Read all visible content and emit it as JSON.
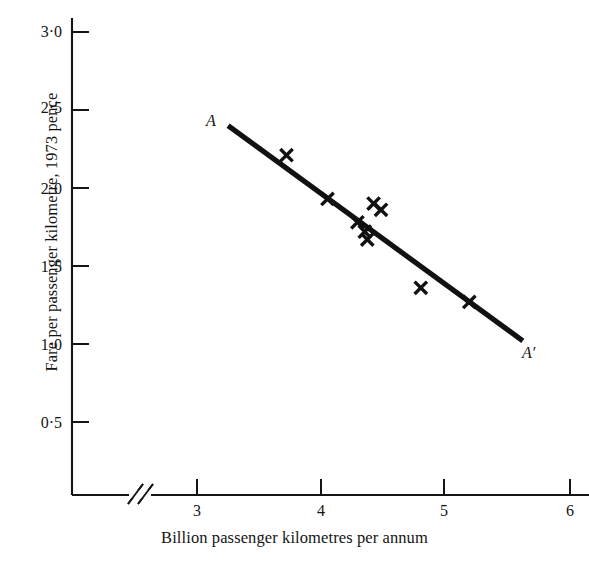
{
  "chart_data": {
    "type": "scatter",
    "title": "",
    "subtitle": "",
    "xlabel": "Billion passenger kilometres per annum",
    "ylabel": "Fare per passenger kilometre, 1973 pence",
    "xlim": [
      2.55,
      6.25
    ],
    "ylim": [
      0.18,
      3.12
    ],
    "x_ticks": [
      "3",
      "4",
      "5",
      "6"
    ],
    "x_tick_values": [
      3,
      4,
      5,
      6
    ],
    "y_ticks": [
      "0·5",
      "1·0",
      "1·5",
      "2·0",
      "2·5",
      "3·0"
    ],
    "y_tick_values": [
      0.5,
      1.0,
      1.5,
      2.0,
      2.5,
      3.0
    ],
    "grid": false,
    "legend": "none",
    "axis_break": "x-axis break between origin and first tick",
    "marker": "cross",
    "points": [
      {
        "x": 3.72,
        "y": 2.21
      },
      {
        "x": 4.05,
        "y": 1.93
      },
      {
        "x": 4.29,
        "y": 1.78
      },
      {
        "x": 4.35,
        "y": 1.72
      },
      {
        "x": 4.37,
        "y": 1.67
      },
      {
        "x": 4.42,
        "y": 1.9
      },
      {
        "x": 4.48,
        "y": 1.86
      },
      {
        "x": 4.8,
        "y": 1.36
      },
      {
        "x": 5.19,
        "y": 1.27
      }
    ],
    "series": [
      {
        "name": "Fitted line A-A'",
        "type": "line",
        "start": {
          "x": 3.25,
          "y": 2.4,
          "label": "A"
        },
        "end": {
          "x": 5.62,
          "y": 1.02,
          "label": "A′"
        }
      }
    ],
    "annotations": [
      {
        "name": "line-start-label",
        "text": "A"
      },
      {
        "name": "line-end-label",
        "text": "A′"
      }
    ],
    "colors": {
      "ink": "#141414",
      "background": "#ffffff",
      "marker": "#111111",
      "trendline": "#111111"
    }
  }
}
